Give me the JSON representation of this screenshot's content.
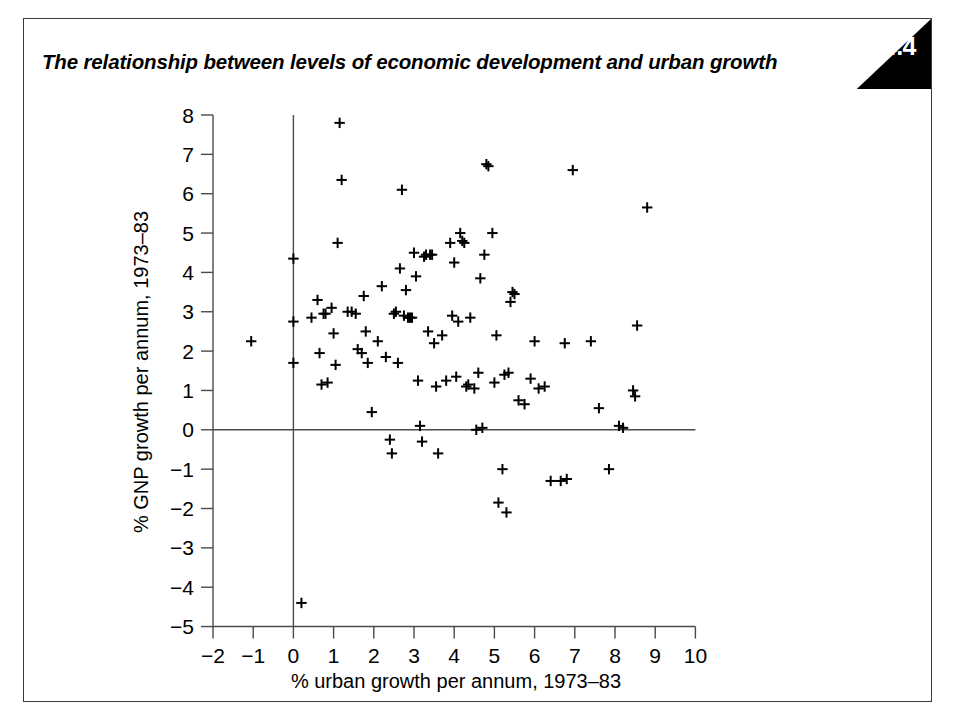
{
  "figure": {
    "number": "4.4",
    "title": "The relationship between levels of economic development and urban growth",
    "background_color": "#ffffff",
    "frame_color": "#3a3a3a",
    "badge_color": "#000000",
    "badge_text_color": "#ffffff",
    "marker_color": "#000000"
  },
  "chart_data": {
    "type": "scatter",
    "title": "The relationship between levels of economic development and urban growth",
    "xlabel": "% urban growth per annum, 1973–83",
    "ylabel": "% GNP growth per annum, 1973–83",
    "xlim": [
      -2,
      10
    ],
    "ylim": [
      -5,
      8
    ],
    "xticks": [
      -2,
      -1,
      0,
      1,
      2,
      3,
      4,
      5,
      6,
      7,
      8,
      9,
      10
    ],
    "yticks": [
      -5,
      -4,
      -3,
      -2,
      -1,
      0,
      1,
      2,
      3,
      4,
      5,
      6,
      7,
      8
    ],
    "xtick_labels": [
      "−2",
      "−1",
      "0",
      "1",
      "2",
      "3",
      "4",
      "5",
      "6",
      "7",
      "8",
      "9",
      "10"
    ],
    "ytick_labels": [
      "−5",
      "−4",
      "−3",
      "−2",
      "−1",
      "0",
      "1",
      "2",
      "3",
      "4",
      "5",
      "6",
      "7",
      "8"
    ],
    "grid": false,
    "legend": false,
    "marker": "plus",
    "reference_lines": [
      {
        "axis": "y",
        "value": 0
      },
      {
        "axis": "x",
        "value": 0
      }
    ],
    "points": [
      [
        -1.05,
        2.25
      ],
      [
        0.0,
        4.35
      ],
      [
        0.0,
        2.75
      ],
      [
        0.0,
        1.7
      ],
      [
        0.2,
        -4.4
      ],
      [
        0.45,
        2.85
      ],
      [
        0.6,
        3.3
      ],
      [
        0.65,
        1.95
      ],
      [
        0.7,
        1.15
      ],
      [
        0.75,
        2.95
      ],
      [
        0.8,
        2.95
      ],
      [
        0.85,
        1.2
      ],
      [
        0.95,
        3.1
      ],
      [
        1.0,
        2.45
      ],
      [
        1.05,
        1.65
      ],
      [
        1.1,
        4.75
      ],
      [
        1.15,
        7.8
      ],
      [
        1.2,
        6.35
      ],
      [
        1.35,
        3.0
      ],
      [
        1.45,
        3.0
      ],
      [
        1.55,
        2.95
      ],
      [
        1.6,
        2.05
      ],
      [
        1.7,
        1.95
      ],
      [
        1.75,
        3.4
      ],
      [
        1.8,
        2.5
      ],
      [
        1.85,
        1.7
      ],
      [
        1.95,
        0.45
      ],
      [
        2.1,
        2.25
      ],
      [
        2.2,
        3.65
      ],
      [
        2.3,
        1.85
      ],
      [
        2.4,
        -0.25
      ],
      [
        2.45,
        -0.6
      ],
      [
        2.5,
        2.95
      ],
      [
        2.55,
        3.0
      ],
      [
        2.6,
        1.7
      ],
      [
        2.65,
        4.1
      ],
      [
        2.7,
        6.1
      ],
      [
        2.75,
        2.9
      ],
      [
        2.8,
        3.55
      ],
      [
        2.85,
        2.85
      ],
      [
        2.9,
        2.85
      ],
      [
        2.95,
        2.85
      ],
      [
        3.0,
        4.5
      ],
      [
        3.05,
        3.9
      ],
      [
        3.1,
        1.25
      ],
      [
        3.15,
        0.1
      ],
      [
        3.2,
        -0.3
      ],
      [
        3.25,
        4.4
      ],
      [
        3.3,
        4.45
      ],
      [
        3.35,
        2.5
      ],
      [
        3.4,
        4.45
      ],
      [
        3.45,
        4.45
      ],
      [
        3.5,
        2.2
      ],
      [
        3.55,
        1.1
      ],
      [
        3.6,
        -0.6
      ],
      [
        3.7,
        2.4
      ],
      [
        3.8,
        1.25
      ],
      [
        3.9,
        4.75
      ],
      [
        3.95,
        2.9
      ],
      [
        4.0,
        4.25
      ],
      [
        4.05,
        1.35
      ],
      [
        4.1,
        2.75
      ],
      [
        4.15,
        5.0
      ],
      [
        4.2,
        4.8
      ],
      [
        4.25,
        4.75
      ],
      [
        4.3,
        1.1
      ],
      [
        4.35,
        1.15
      ],
      [
        4.4,
        2.85
      ],
      [
        4.5,
        1.05
      ],
      [
        4.55,
        0.0
      ],
      [
        4.6,
        1.45
      ],
      [
        4.65,
        3.85
      ],
      [
        4.7,
        0.05
      ],
      [
        4.75,
        4.45
      ],
      [
        4.8,
        6.75
      ],
      [
        4.85,
        6.7
      ],
      [
        4.95,
        5.0
      ],
      [
        5.0,
        1.2
      ],
      [
        5.05,
        2.4
      ],
      [
        5.1,
        -1.85
      ],
      [
        5.2,
        -1.0
      ],
      [
        5.25,
        1.4
      ],
      [
        5.3,
        -2.1
      ],
      [
        5.35,
        1.45
      ],
      [
        5.4,
        3.25
      ],
      [
        5.45,
        3.5
      ],
      [
        5.5,
        3.45
      ],
      [
        5.6,
        0.75
      ],
      [
        5.75,
        0.65
      ],
      [
        5.9,
        1.3
      ],
      [
        6.0,
        2.25
      ],
      [
        6.1,
        1.05
      ],
      [
        6.25,
        1.1
      ],
      [
        6.4,
        -1.3
      ],
      [
        6.65,
        -1.3
      ],
      [
        6.75,
        2.2
      ],
      [
        6.8,
        -1.25
      ],
      [
        6.95,
        6.6
      ],
      [
        7.4,
        2.25
      ],
      [
        7.6,
        0.55
      ],
      [
        7.85,
        -1.0
      ],
      [
        8.1,
        0.1
      ],
      [
        8.2,
        0.05
      ],
      [
        8.45,
        1.0
      ],
      [
        8.5,
        0.85
      ],
      [
        8.55,
        2.65
      ],
      [
        8.8,
        5.65
      ]
    ]
  }
}
